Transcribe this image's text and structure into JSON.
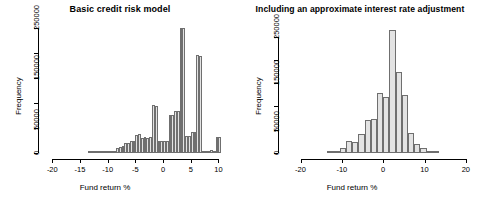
{
  "figure": {
    "background": "#ffffff",
    "bar_fill": "#e3e3e3",
    "bar_stroke": "#6f6f6f",
    "axis_color": "#000000"
  },
  "chart_data": [
    {
      "type": "bar",
      "title": "Basic credit risk model",
      "xlabel": "Fund return %",
      "ylabel": "Frequency",
      "xlim": [
        -21.5,
        11.0
      ],
      "ylim": [
        0,
        255000
      ],
      "grid": false,
      "legend": null,
      "xticks": [
        -20,
        -15,
        -10,
        -5,
        0,
        5,
        10
      ],
      "xtick_labels": [
        "-20",
        "-15",
        "-10",
        "-5",
        "0",
        "5",
        "10"
      ],
      "yticks": [
        0,
        50000,
        100000,
        150000,
        200000,
        250000
      ],
      "ytick_labels": [
        "0",
        "50000",
        "",
        "150000",
        "",
        "250000"
      ],
      "bin_width": 0.5,
      "bins": [
        {
          "x0": -13.5,
          "x1": -13.0,
          "value": 800
        },
        {
          "x0": -13.0,
          "x1": -12.5,
          "value": 900
        },
        {
          "x0": -12.5,
          "x1": -12.0,
          "value": 1000
        },
        {
          "x0": -12.0,
          "x1": -11.5,
          "value": 1200
        },
        {
          "x0": -11.5,
          "x1": -11.0,
          "value": 1500
        },
        {
          "x0": -11.0,
          "x1": -10.5,
          "value": 1800
        },
        {
          "x0": -10.5,
          "x1": -10.0,
          "value": 2200
        },
        {
          "x0": -10.0,
          "x1": -9.5,
          "value": 3500
        },
        {
          "x0": -9.5,
          "x1": -9.0,
          "value": 4000
        },
        {
          "x0": -9.0,
          "x1": -8.5,
          "value": 5000
        },
        {
          "x0": -8.5,
          "x1": -8.0,
          "value": 9000
        },
        {
          "x0": -8.0,
          "x1": -7.5,
          "value": 11000
        },
        {
          "x0": -7.5,
          "x1": -7.0,
          "value": 14000
        },
        {
          "x0": -7.0,
          "x1": -6.5,
          "value": 19000
        },
        {
          "x0": -6.5,
          "x1": -6.0,
          "value": 20000
        },
        {
          "x0": -6.0,
          "x1": -5.5,
          "value": 24000
        },
        {
          "x0": -5.5,
          "x1": -5.0,
          "value": 23000
        },
        {
          "x0": -5.0,
          "x1": -4.5,
          "value": 36000
        },
        {
          "x0": -4.5,
          "x1": -4.0,
          "value": 37000
        },
        {
          "x0": -4.0,
          "x1": -3.5,
          "value": 30000
        },
        {
          "x0": -3.5,
          "x1": -3.0,
          "value": 31000
        },
        {
          "x0": -3.0,
          "x1": -2.5,
          "value": 30000
        },
        {
          "x0": -2.5,
          "x1": -2.0,
          "value": 31000
        },
        {
          "x0": -2.0,
          "x1": -1.5,
          "value": 95000
        },
        {
          "x0": -1.5,
          "x1": -1.0,
          "value": 94000
        },
        {
          "x0": -1.0,
          "x1": -0.5,
          "value": 24000
        },
        {
          "x0": -0.5,
          "x1": 0.0,
          "value": 24000
        },
        {
          "x0": 0.0,
          "x1": 0.5,
          "value": 24000
        },
        {
          "x0": 0.5,
          "x1": 1.0,
          "value": 23000
        },
        {
          "x0": 1.0,
          "x1": 1.5,
          "value": 76000
        },
        {
          "x0": 1.5,
          "x1": 2.0,
          "value": 76000
        },
        {
          "x0": 2.0,
          "x1": 2.5,
          "value": 84000
        },
        {
          "x0": 2.5,
          "x1": 3.0,
          "value": 83000
        },
        {
          "x0": 3.0,
          "x1": 3.5,
          "value": 250000
        },
        {
          "x0": 3.5,
          "x1": 4.0,
          "value": 249000
        },
        {
          "x0": 4.0,
          "x1": 4.5,
          "value": 34000
        },
        {
          "x0": 4.5,
          "x1": 5.0,
          "value": 33000
        },
        {
          "x0": 5.0,
          "x1": 5.5,
          "value": 41000
        },
        {
          "x0": 5.5,
          "x1": 6.0,
          "value": 42000
        },
        {
          "x0": 6.0,
          "x1": 6.5,
          "value": 195000
        },
        {
          "x0": 6.5,
          "x1": 7.0,
          "value": 194000
        },
        {
          "x0": 7.0,
          "x1": 7.5,
          "value": 4000
        },
        {
          "x0": 7.5,
          "x1": 8.0,
          "value": 4500
        },
        {
          "x0": 8.0,
          "x1": 8.5,
          "value": 5000
        },
        {
          "x0": 8.5,
          "x1": 9.0,
          "value": 5500
        },
        {
          "x0": 9.0,
          "x1": 9.5,
          "value": 3000
        },
        {
          "x0": 9.5,
          "x1": 10.0,
          "value": 32000
        },
        {
          "x0": 10.0,
          "x1": 10.5,
          "value": 32000
        }
      ]
    },
    {
      "type": "bar",
      "title": "Including an approximate interest rate adjustment",
      "xlabel": "Fund return %",
      "ylabel": "Frequency",
      "xlim": [
        -24.0,
        21.0
      ],
      "ylim": [
        0,
        275000
      ],
      "grid": false,
      "legend": null,
      "xticks": [
        -20,
        -10,
        0,
        10,
        20
      ],
      "xtick_labels": [
        "-20",
        "-10",
        "0",
        "10",
        "20"
      ],
      "yticks": [
        0,
        50000,
        100000,
        150000,
        200000,
        250000
      ],
      "ytick_labels": [
        "0",
        "50000",
        "",
        "150000",
        "",
        "250000"
      ],
      "bin_width": 1.5,
      "bins": [
        {
          "x0": -13.5,
          "x1": -12.0,
          "value": 1500
        },
        {
          "x0": -12.0,
          "x1": -10.5,
          "value": 3000
        },
        {
          "x0": -10.5,
          "x1": -9.0,
          "value": 11000
        },
        {
          "x0": -9.0,
          "x1": -7.5,
          "value": 25000
        },
        {
          "x0": -7.5,
          "x1": -6.0,
          "value": 24000
        },
        {
          "x0": -6.0,
          "x1": -4.5,
          "value": 40000
        },
        {
          "x0": -4.5,
          "x1": -3.0,
          "value": 72000
        },
        {
          "x0": -3.0,
          "x1": -1.5,
          "value": 74000
        },
        {
          "x0": -1.5,
          "x1": 0.0,
          "value": 128000
        },
        {
          "x0": 0.0,
          "x1": 1.5,
          "value": 120000
        },
        {
          "x0": 1.5,
          "x1": 3.0,
          "value": 265000
        },
        {
          "x0": 3.0,
          "x1": 4.5,
          "value": 175000
        },
        {
          "x0": 4.5,
          "x1": 6.0,
          "value": 125000
        },
        {
          "x0": 6.0,
          "x1": 7.5,
          "value": 44000
        },
        {
          "x0": 7.5,
          "x1": 9.0,
          "value": 20000
        },
        {
          "x0": 9.0,
          "x1": 10.5,
          "value": 11000
        },
        {
          "x0": 10.5,
          "x1": 12.0,
          "value": 3500
        },
        {
          "x0": 12.0,
          "x1": 13.5,
          "value": 1500
        }
      ]
    }
  ]
}
